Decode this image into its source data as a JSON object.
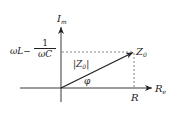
{
  "diagram": {
    "type": "impedance phasor diagram",
    "axes": {
      "vertical": {
        "label": "I",
        "subscript": "m"
      },
      "horizontal": {
        "label": "R",
        "subscript": "e"
      }
    },
    "vector": {
      "label": "Z",
      "subscript": "0",
      "magnitude_label": "|Z",
      "magnitude_subscript": "0",
      "magnitude_close": "|"
    },
    "angle_label": "φ",
    "x_projection_label": "R",
    "y_projection_label": {
      "left": "ωL−",
      "numerator": "1",
      "denominator": "ωC"
    },
    "colors": {
      "ink": "#222222",
      "dashed": "#555555"
    }
  }
}
